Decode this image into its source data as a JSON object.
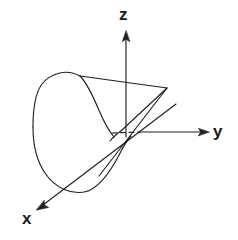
{
  "figure": {
    "kind": "3d-coordinate-diagram",
    "background_color": "#ffffff",
    "stroke_color": "#231f20",
    "axes": [
      {
        "id": "z",
        "label": "z",
        "direction": "up",
        "style": "solid-with-arrowhead"
      },
      {
        "id": "y",
        "label": "y",
        "direction": "right",
        "style": "dashed-near-origin-then-solid-with-arrowhead"
      },
      {
        "id": "x",
        "label": "x",
        "direction": "down-left",
        "style": "solid-with-arrowhead"
      }
    ],
    "surface": {
      "name": "parabolic-cylinder",
      "far_edge": "parabola opening upward at upper left",
      "near_edge": "narrow wedge apex at right",
      "fill": "none",
      "line_width": "1"
    }
  }
}
